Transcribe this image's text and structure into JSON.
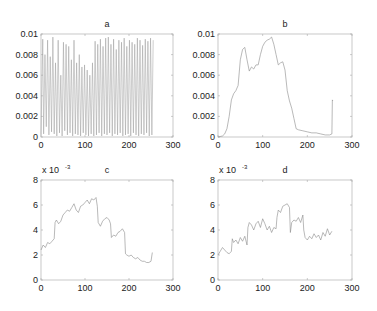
{
  "chart_data": [
    {
      "id": "a",
      "type": "line",
      "title": "a",
      "xlabel": "",
      "ylabel": "",
      "xlim": [
        0,
        300
      ],
      "ylim": [
        0,
        0.01
      ],
      "xticks": [
        0,
        100,
        200,
        300
      ],
      "yticks": [
        0,
        0.002,
        0.004,
        0.006,
        0.008,
        0.01
      ],
      "ytick_labels": [
        "0",
        "0.002",
        "0.004",
        "0.006",
        "0.008",
        "0.01"
      ],
      "exponent_label": "",
      "grid": false,
      "series_color": "#9a9a9a",
      "x": [
        0,
        4,
        6,
        9,
        12,
        15,
        18,
        21,
        24,
        27,
        30,
        33,
        36,
        39,
        42,
        45,
        48,
        51,
        54,
        57,
        60,
        63,
        66,
        69,
        72,
        75,
        78,
        81,
        84,
        87,
        90,
        93,
        96,
        99,
        102,
        105,
        108,
        111,
        114,
        117,
        120,
        123,
        126,
        129,
        132,
        135,
        138,
        141,
        144,
        147,
        150,
        153,
        156,
        159,
        162,
        165,
        168,
        171,
        174,
        177,
        180,
        183,
        186,
        189,
        192,
        195,
        198,
        201,
        204,
        207,
        210,
        213,
        216,
        219,
        222,
        225,
        228,
        231,
        234,
        237,
        240,
        243,
        246,
        249,
        252,
        255
      ],
      "values": [
        0.0002,
        0.0095,
        0.0003,
        0.008,
        0.001,
        0.0094,
        0.0002,
        0.0078,
        0.0005,
        0.0097,
        0.0003,
        0.0072,
        0.0001,
        0.0094,
        0.0004,
        0.006,
        0.0001,
        0.0092,
        0.0006,
        0.009,
        0.0002,
        0.0088,
        0.0004,
        0.0075,
        0.0001,
        0.0094,
        0.0003,
        0.0072,
        0.0002,
        0.008,
        0.0001,
        0.0068,
        0.0004,
        0.007,
        0.0002,
        0.0065,
        0.0001,
        0.006,
        0.0003,
        0.0072,
        0.0001,
        0.0093,
        0.0002,
        0.009,
        0.0004,
        0.0095,
        0.0001,
        0.0088,
        0.0003,
        0.0096,
        0.0002,
        0.0097,
        0.0004,
        0.009,
        0.0001,
        0.0095,
        0.0003,
        0.0085,
        0.0002,
        0.0094,
        0.0004,
        0.0092,
        0.0001,
        0.0096,
        0.0002,
        0.0088,
        0.0003,
        0.0094,
        0.0001,
        0.0092,
        0.0004,
        0.009,
        0.0002,
        0.0096,
        0.0001,
        0.0094,
        0.0003,
        0.0089,
        0.0002,
        0.0095,
        0.0004,
        0.0093,
        0.0001,
        0.0096,
        0.0002,
        0.0094
      ]
    },
    {
      "id": "b",
      "type": "line",
      "title": "b",
      "xlabel": "",
      "ylabel": "",
      "xlim": [
        0,
        300
      ],
      "ylim": [
        0,
        0.01
      ],
      "xticks": [
        0,
        100,
        200,
        300
      ],
      "yticks": [
        0,
        0.002,
        0.004,
        0.006,
        0.008,
        0.01
      ],
      "ytick_labels": [
        "0",
        "0.002",
        "0.004",
        "0.006",
        "0.008",
        "0.01"
      ],
      "exponent_label": "",
      "grid": false,
      "series_color": "#8a8a8a",
      "x": [
        0,
        10,
        15,
        20,
        25,
        30,
        35,
        40,
        45,
        50,
        55,
        60,
        65,
        70,
        75,
        80,
        85,
        90,
        95,
        100,
        105,
        110,
        115,
        120,
        125,
        130,
        135,
        140,
        145,
        150,
        155,
        160,
        165,
        170,
        175,
        180,
        190,
        200,
        210,
        220,
        230,
        240,
        250,
        255,
        256,
        257
      ],
      "values": [
        0,
        0.0001,
        0.0003,
        0.0008,
        0.002,
        0.0036,
        0.0042,
        0.0045,
        0.005,
        0.0075,
        0.0085,
        0.0087,
        0.0075,
        0.0064,
        0.0068,
        0.0066,
        0.007,
        0.007,
        0.008,
        0.0088,
        0.0092,
        0.0094,
        0.0095,
        0.0097,
        0.009,
        0.008,
        0.007,
        0.0072,
        0.0073,
        0.0065,
        0.0045,
        0.0035,
        0.0028,
        0.0018,
        0.0008,
        0.0007,
        0.0006,
        0.0005,
        0.0004,
        0.0004,
        0.0003,
        0.0002,
        0.0002,
        0.0003,
        0.0036,
        0.0035
      ]
    },
    {
      "id": "c",
      "type": "line",
      "title": "c",
      "xlabel": "",
      "ylabel": "",
      "xlim": [
        0,
        300
      ],
      "ylim": [
        0,
        8
      ],
      "xticks": [
        0,
        100,
        200,
        300
      ],
      "yticks": [
        0,
        2,
        4,
        6,
        8
      ],
      "ytick_labels": [
        "0",
        "2",
        "4",
        "6",
        "8"
      ],
      "exponent_label": "x 10",
      "exponent_power": "-3",
      "grid": false,
      "series_color": "#8a8a8a",
      "x": [
        0,
        5,
        10,
        15,
        20,
        25,
        30,
        32,
        35,
        40,
        45,
        50,
        55,
        60,
        65,
        70,
        75,
        80,
        85,
        90,
        95,
        100,
        105,
        110,
        115,
        120,
        125,
        128,
        130,
        135,
        140,
        145,
        150,
        155,
        158,
        160,
        165,
        170,
        175,
        180,
        185,
        190,
        192,
        195,
        200,
        205,
        210,
        215,
        220,
        225,
        230,
        235,
        240,
        245,
        250,
        253
      ],
      "values": [
        2.4,
        2.8,
        2.6,
        3.0,
        2.9,
        3.1,
        3.3,
        4.6,
        4.8,
        4.5,
        4.7,
        5.2,
        5.4,
        5.6,
        5.5,
        5.8,
        6.1,
        5.6,
        5.4,
        5.9,
        6.0,
        6.2,
        6.4,
        6.1,
        6.5,
        6.4,
        6.6,
        5.9,
        4.6,
        4.3,
        4.7,
        4.9,
        5.0,
        4.8,
        4.5,
        3.4,
        3.6,
        3.5,
        3.8,
        3.9,
        4.1,
        3.8,
        2.1,
        2.0,
        1.9,
        2.0,
        1.8,
        1.7,
        1.8,
        1.6,
        1.5,
        1.5,
        1.4,
        1.4,
        1.5,
        2.2
      ]
    },
    {
      "id": "d",
      "type": "line",
      "title": "d",
      "xlabel": "",
      "ylabel": "",
      "xlim": [
        0,
        300
      ],
      "ylim": [
        0,
        8
      ],
      "xticks": [
        0,
        100,
        200,
        300
      ],
      "yticks": [
        0,
        2,
        4,
        6,
        8
      ],
      "ytick_labels": [
        "0",
        "2",
        "4",
        "6",
        "8"
      ],
      "exponent_label": "x 10",
      "exponent_power": "-3",
      "grid": false,
      "series_color": "#8a8a8a",
      "x": [
        0,
        5,
        10,
        15,
        20,
        25,
        30,
        32,
        35,
        40,
        45,
        50,
        55,
        60,
        65,
        67,
        70,
        75,
        80,
        85,
        90,
        95,
        100,
        105,
        110,
        115,
        120,
        125,
        130,
        132,
        135,
        140,
        145,
        150,
        155,
        160,
        162,
        165,
        170,
        175,
        180,
        185,
        190,
        192,
        195,
        200,
        205,
        210,
        215,
        220,
        225,
        230,
        235,
        240,
        245,
        250,
        255
      ],
      "values": [
        2.0,
        2.3,
        2.6,
        2.4,
        2.2,
        2.1,
        2.3,
        3.3,
        3.0,
        3.2,
        2.9,
        3.4,
        3.1,
        3.5,
        2.8,
        4.2,
        4.6,
        4.4,
        4.0,
        4.5,
        4.7,
        4.2,
        4.9,
        4.5,
        4.0,
        4.3,
        3.8,
        4.2,
        4.1,
        5.0,
        5.6,
        5.4,
        5.9,
        6.0,
        6.1,
        5.8,
        3.8,
        4.6,
        4.8,
        4.7,
        5.0,
        4.6,
        5.2,
        4.0,
        3.4,
        3.2,
        3.5,
        3.3,
        3.7,
        3.4,
        3.6,
        3.2,
        3.8,
        3.5,
        4.1,
        3.6,
        3.9
      ]
    }
  ],
  "panels": {
    "a": {
      "title": "a"
    },
    "b": {
      "title": "b"
    },
    "c": {
      "title": "c",
      "exponent": "x 10",
      "exponent_power": "-3"
    },
    "d": {
      "title": "d",
      "exponent": "x 10",
      "exponent_power": "-3"
    }
  }
}
